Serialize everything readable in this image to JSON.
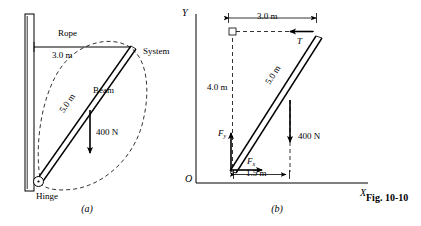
{
  "figure": {
    "caption": "Fig. 10-10",
    "panels": [
      {
        "id": "a",
        "label": "(a)"
      },
      {
        "id": "b",
        "label": "(b)"
      }
    ]
  },
  "panel_a": {
    "labels": {
      "rope": "Rope",
      "rope_length": "3.0 m",
      "system": "System",
      "beam": "Beam",
      "beam_length": "5.0 m",
      "weight": "400 N",
      "hinge": "Hinge"
    }
  },
  "panel_b": {
    "labels": {
      "axis_y": "Y",
      "axis_x": "X",
      "origin": "O",
      "horizontal_span": "3.0 m",
      "vertical_span": "4.0 m",
      "beam_length": "5.0 m",
      "base_offset": "1.5 m",
      "weight": "400 N",
      "tension": "T",
      "force_vertical": "F",
      "force_vertical_sub": "y",
      "force_horizontal": "F",
      "force_horizontal_sub": "x"
    }
  },
  "colors": {
    "ink": "#000000",
    "paper": "#ffffff"
  }
}
